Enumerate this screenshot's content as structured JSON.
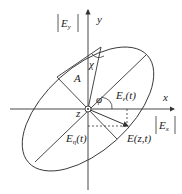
{
  "diagram": {
    "labels": {
      "ey_mag": "|E",
      "ey_sub": "y",
      "ex_mag": "|E",
      "ex_sub": "x",
      "y_axis": "y",
      "x_axis": "x",
      "z_axis": "z",
      "chi": "χ",
      "A": "A",
      "phi": "φ",
      "eps_E": "E",
      "eps_sub": "ε",
      "eps_t": "(t)",
      "eta_E": "E",
      "eta_sub": "η",
      "eta_t": "(t)",
      "field": "E(z,t)"
    },
    "colors": {
      "stroke": "#333333",
      "background": "#ffffff"
    }
  }
}
